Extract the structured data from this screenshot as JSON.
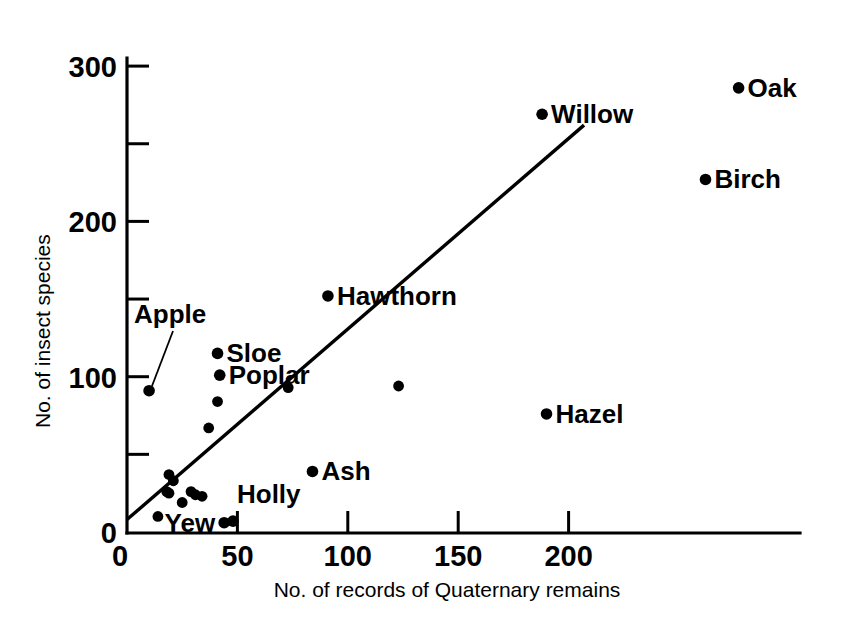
{
  "chart_data": {
    "type": "scatter",
    "title": "",
    "xlabel": "No. of records of Quaternary remains",
    "ylabel": "No. of insect species",
    "xlim": [
      0,
      222
    ],
    "ylim": [
      0,
      310
    ],
    "xticks": [
      0,
      50,
      100,
      150,
      200
    ],
    "yticks": [
      0,
      50,
      100,
      150,
      200,
      250,
      300
    ],
    "xtick_labels": [
      "0",
      "50",
      "100",
      "150",
      "200"
    ],
    "ytick_labels": [
      "0",
      "50",
      "100",
      "150",
      "200",
      "250",
      "300"
    ],
    "grid": false,
    "legend": false,
    "marker_color": "#000000",
    "line_color": "#000000",
    "points": [
      {
        "label": "Apple",
        "x": 10,
        "y": 91,
        "label_pos": "leader"
      },
      {
        "label": "Sloe",
        "x": 41,
        "y": 115,
        "label_pos": "right"
      },
      {
        "label": "Poplar",
        "x": 42,
        "y": 101,
        "label_pos": "right"
      },
      {
        "label": "",
        "x": 41,
        "y": 84,
        "label_pos": "none"
      },
      {
        "label": "",
        "x": 37,
        "y": 67,
        "label_pos": "none"
      },
      {
        "label": "",
        "x": 73,
        "y": 93,
        "label_pos": "none"
      },
      {
        "label": "Hawthorn",
        "x": 91,
        "y": 152,
        "label_pos": "right"
      },
      {
        "label": "",
        "x": 123,
        "y": 94,
        "label_pos": "none"
      },
      {
        "label": "Hazel",
        "x": 190,
        "y": 76,
        "label_pos": "right"
      },
      {
        "label": "Ash",
        "x": 84,
        "y": 39,
        "label_pos": "right"
      },
      {
        "label": "Willow",
        "x": 188,
        "y": 269,
        "label_pos": "right"
      },
      {
        "label": "Oak",
        "x": 277,
        "y": 286,
        "label_pos": "right"
      },
      {
        "label": "Birch",
        "x": 262,
        "y": 227,
        "label_pos": "right"
      },
      {
        "label": "",
        "x": 19,
        "y": 37,
        "label_pos": "none"
      },
      {
        "label": "",
        "x": 21,
        "y": 33,
        "label_pos": "none"
      },
      {
        "label": "",
        "x": 18,
        "y": 26,
        "label_pos": "none"
      },
      {
        "label": "",
        "x": 19,
        "y": 25,
        "label_pos": "none"
      },
      {
        "label": "",
        "x": 25,
        "y": 19,
        "label_pos": "none"
      },
      {
        "label": "",
        "x": 29,
        "y": 26,
        "label_pos": "none"
      },
      {
        "label": "",
        "x": 31,
        "y": 24,
        "label_pos": "none"
      },
      {
        "label": "",
        "x": 34,
        "y": 23,
        "label_pos": "none"
      },
      {
        "label": "",
        "x": 14,
        "y": 10,
        "label_pos": "none"
      },
      {
        "label": "Yew",
        "x": 44,
        "y": 6,
        "label_pos": "left"
      },
      {
        "label": "Holly",
        "x": 48,
        "y": 7,
        "label_pos": "above-right"
      }
    ],
    "trend_line": {
      "x_start": 0,
      "y_start": 8,
      "x_end": 207,
      "y_end": 262
    },
    "annotations": [
      {
        "text": "Apple",
        "note": "label with leader line pointing down-left to its marker"
      }
    ]
  }
}
